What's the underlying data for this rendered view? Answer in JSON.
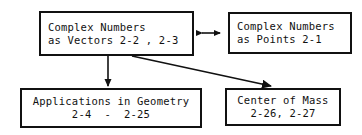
{
  "diagram": {
    "background_color": "#ffffff",
    "line_color": "#111111",
    "nodes": [
      {
        "id": "vectors",
        "line1": "Complex Numbers",
        "line2": "as Vectors 2-2 , 2-3"
      },
      {
        "id": "points",
        "line1": "Complex Numbers",
        "line2": "as Points 2-1"
      },
      {
        "id": "applications",
        "line1": "Applications in Geometry",
        "line2": "2-4  -  2-25"
      },
      {
        "id": "center_mass",
        "line1": "Center of Mass",
        "line2": "2-26, 2-27"
      }
    ],
    "connectors": [
      {
        "id": "vectors-points",
        "from": "vectors",
        "to": "points",
        "style": "double-headed-horizontal-arrow"
      },
      {
        "id": "vectors-applications",
        "from": "vectors",
        "to": "applications",
        "style": "single-headed-vertical-arrow"
      },
      {
        "id": "vectors-center-mass",
        "from": "vectors",
        "to": "center_mass",
        "style": "single-headed-diagonal-arrow"
      }
    ]
  }
}
